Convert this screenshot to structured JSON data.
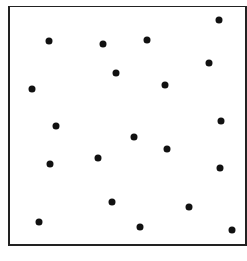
{
  "figure": {
    "frame_color": "#222222",
    "dot_color": "#111111",
    "dot_count": 20
  },
  "chart_data": {
    "type": "scatter",
    "title": "",
    "xlabel": "",
    "ylabel": "",
    "grid": false,
    "points": [
      {
        "x": 49,
        "y": 41
      },
      {
        "x": 103,
        "y": 44
      },
      {
        "x": 116,
        "y": 73
      },
      {
        "x": 32,
        "y": 89
      },
      {
        "x": 56,
        "y": 126
      },
      {
        "x": 219,
        "y": 20
      },
      {
        "x": 147,
        "y": 40
      },
      {
        "x": 209,
        "y": 63
      },
      {
        "x": 165,
        "y": 85
      },
      {
        "x": 221,
        "y": 121
      },
      {
        "x": 50,
        "y": 164
      },
      {
        "x": 98,
        "y": 158
      },
      {
        "x": 112,
        "y": 202
      },
      {
        "x": 39,
        "y": 222
      },
      {
        "x": 134,
        "y": 137
      },
      {
        "x": 167,
        "y": 149
      },
      {
        "x": 220,
        "y": 168
      },
      {
        "x": 189,
        "y": 207
      },
      {
        "x": 140,
        "y": 227
      },
      {
        "x": 232,
        "y": 230
      }
    ]
  }
}
